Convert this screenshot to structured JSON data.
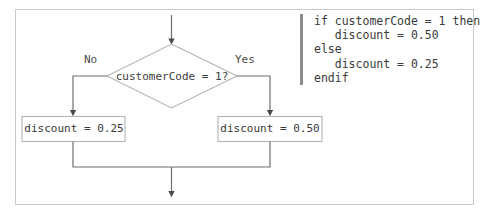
{
  "figure": {
    "type": "flowchart-with-pseudocode",
    "border_color": "#c9c9c9",
    "line_color": "#6e6e6e",
    "shape_border_color": "#b3b3b3",
    "text_color": "#3a3a3a",
    "rule_color": "#8c8c8c"
  },
  "flowchart": {
    "entry_arrow": {
      "name": "entry-connector",
      "direction": "down"
    },
    "decision": {
      "label": "customerCode = 1?",
      "shape": "diamond"
    },
    "branches": {
      "left_label": "No",
      "right_label": "Yes"
    },
    "process_left": {
      "label": "discount = 0.25",
      "shape": "rectangle"
    },
    "process_right": {
      "label": "discount = 0.50",
      "shape": "rectangle"
    },
    "exit_arrow": {
      "name": "exit-connector",
      "direction": "down"
    }
  },
  "pseudocode": {
    "lines": [
      "if customerCode = 1 then",
      "   discount = 0.50",
      "else",
      "   discount = 0.25",
      "endif"
    ],
    "text": "if customerCode = 1 then\n   discount = 0.50\nelse\n   discount = 0.25\nendif"
  }
}
